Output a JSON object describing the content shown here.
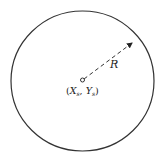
{
  "diagram": {
    "type": "circle-with-radius",
    "labels": {
      "radius": "R",
      "center_x": "X",
      "center_x_sub": "s",
      "center_y": "Y",
      "center_y_sub": "s",
      "center_open": "(",
      "center_sep": ", ",
      "center_close": ")"
    },
    "colors": {
      "stroke": "#333333",
      "background": "#ffffff"
    }
  }
}
